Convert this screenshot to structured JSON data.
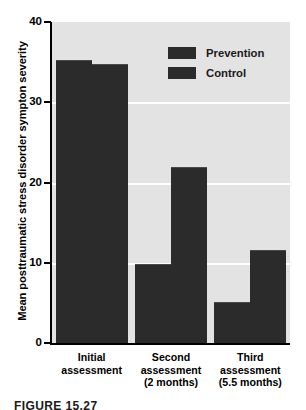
{
  "chart_data": {
    "type": "bar",
    "title": "",
    "xlabel": "",
    "ylabel": "Mean posttraumatic stress disorder sympton severity",
    "ylim": [
      0,
      40
    ],
    "yticks": [
      0,
      10,
      20,
      30,
      40
    ],
    "ytick_labels": [
      "0",
      "10",
      "20",
      "30",
      "40"
    ],
    "grid": true,
    "grid_axis": "y",
    "legend_position": "top-right",
    "categories": [
      "Initial assessment",
      "Second assessment (2 months)",
      "Third assessment (5.5 months)"
    ],
    "category_lines": [
      [
        "Initial",
        "assessment"
      ],
      [
        "Second",
        "assessment",
        "(2 months)"
      ],
      [
        "Third",
        "assessment",
        "(5.5 months)"
      ]
    ],
    "series": [
      {
        "name": "Prevention",
        "values": [
          35.2,
          9.7,
          5.0
        ],
        "color": "#2b2b2b"
      },
      {
        "name": "Control",
        "values": [
          34.7,
          21.8,
          11.5
        ],
        "color": "#2b2b2b"
      }
    ]
  },
  "legend": {
    "items": [
      {
        "label": "Prevention"
      },
      {
        "label": "Control"
      }
    ]
  },
  "caption": {
    "text": "FIGURE 15.27"
  },
  "colors": {
    "plot_background": "#e3e3e3",
    "page_background": "#ffffff",
    "bar": "#2b2b2b",
    "gridline": "#ffffff",
    "axis": "#000000",
    "text": "#000000"
  }
}
